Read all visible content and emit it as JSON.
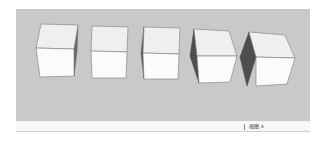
{
  "viewport": {
    "background_color": "#c9c9c9",
    "objects": [
      {
        "name": "cube-1",
        "shape": "cube",
        "top_color": "#efefef",
        "front_color": "#fbfbfb",
        "side_color": "#6a6a6a",
        "edge_color": "#7a7a7a"
      },
      {
        "name": "cube-2",
        "shape": "cube",
        "top_color": "#efefef",
        "front_color": "#fbfbfb",
        "side_color": "#6a6a6a",
        "edge_color": "#7a7a7a"
      },
      {
        "name": "cube-3",
        "shape": "cube",
        "top_color": "#efefef",
        "front_color": "#fbfbfb",
        "side_color": "#5a5a5a",
        "edge_color": "#7a7a7a"
      },
      {
        "name": "cube-4",
        "shape": "cube",
        "top_color": "#efefef",
        "front_color": "#fbfbfb",
        "side_color": "#4e4e4e",
        "edge_color": "#7a7a7a"
      },
      {
        "name": "cube-5",
        "shape": "cube",
        "top_color": "#efefef",
        "front_color": "#fbfbfb",
        "side_color": "#4e4e4e",
        "edge_color": "#7a7a7a"
      }
    ]
  },
  "statusbar": {
    "text": "视图 ∧",
    "background_color": "#f7f7f7"
  }
}
